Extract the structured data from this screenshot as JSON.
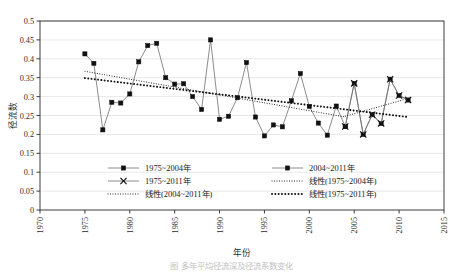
{
  "figure": {
    "caption": "图  多年平均径流深及径流系数变化",
    "background": "#ffffff",
    "plot_border_color": "#3c3c3c",
    "gridline_color": "#d6d6d6",
    "series_line_color": "#6e6e6e",
    "marker_color": "#111111",
    "trend_color": "#111111"
  },
  "chart_data": {
    "type": "line",
    "title": "",
    "xlabel": "年份",
    "ylabel": "径流数",
    "xlim": [
      1970,
      2015
    ],
    "ylim": [
      0,
      0.5
    ],
    "xticks": [
      1970,
      1975,
      1980,
      1985,
      1990,
      1995,
      2000,
      2005,
      2010,
      2015
    ],
    "yticks": [
      0,
      0.05,
      0.1,
      0.15,
      0.2,
      0.25,
      0.3,
      0.35,
      0.4,
      0.45,
      0.5
    ],
    "ytick_labels": [
      "0",
      "0.05",
      "0.1",
      "0.15",
      "0.2",
      "0.25",
      "0.3",
      "0.35",
      "0.4",
      "0.45",
      "0.5"
    ],
    "xtick_labels": [
      "1970",
      "1975",
      "1980",
      "1985",
      "1990",
      "1995",
      "2000",
      "2005",
      "2010",
      "2015"
    ],
    "grid": "horizontal",
    "legend_position": "inside-bottom",
    "series": [
      {
        "name": "1975~2004年",
        "marker": "square",
        "x": [
          1975,
          1976,
          1977,
          1978,
          1979,
          1980,
          1981,
          1982,
          1983,
          1984,
          1985,
          1986,
          1987,
          1988,
          1989,
          1990,
          1991,
          1992,
          1993,
          1994,
          1995,
          1996,
          1997,
          1998,
          1999,
          2000,
          2001,
          2002,
          2003,
          2004
        ],
        "values": [
          0.413,
          0.388,
          0.212,
          0.285,
          0.283,
          0.307,
          0.392,
          0.435,
          0.441,
          0.35,
          0.333,
          0.334,
          0.3,
          0.266,
          0.45,
          0.24,
          0.248,
          0.297,
          0.39,
          0.246,
          0.196,
          0.225,
          0.22,
          0.289,
          0.361,
          0.274,
          0.23,
          0.198,
          0.275,
          0.221
        ]
      },
      {
        "name": "2004~2011年",
        "marker": "square",
        "x": [
          2004,
          2005,
          2006,
          2007,
          2008,
          2009,
          2010,
          2011
        ],
        "values": [
          0.221,
          0.335,
          0.2,
          0.252,
          0.229,
          0.346,
          0.303,
          0.291
        ]
      },
      {
        "name": "1975~2011年",
        "marker": "cross",
        "x": [
          2004,
          2005,
          2006,
          2007,
          2008,
          2009,
          2010,
          2011
        ],
        "values": [
          0.221,
          0.335,
          0.2,
          0.252,
          0.229,
          0.346,
          0.303,
          0.291
        ]
      }
    ],
    "trendlines": [
      {
        "name": "线性(1975~2004年)",
        "style": "fine-dotted",
        "x": [
          1975,
          2004
        ],
        "y": [
          0.367,
          0.246
        ]
      },
      {
        "name": "线性(2004~2011年)",
        "style": "fine-dotted",
        "x": [
          2004,
          2011
        ],
        "y": [
          0.248,
          0.295
        ]
      },
      {
        "name": "线性(1975~2011年)",
        "style": "bold-dotted",
        "x": [
          1975,
          2011
        ],
        "y": [
          0.349,
          0.246
        ]
      }
    ]
  },
  "legend": {
    "items": [
      {
        "label": "1975~2004年",
        "type": "line-marker-square",
        "col": 0,
        "row": 0
      },
      {
        "label": "2004~2011年",
        "type": "line-marker-square",
        "col": 1,
        "row": 0
      },
      {
        "label": "1975~2011年",
        "type": "line-marker-cross",
        "col": 0,
        "row": 1
      },
      {
        "label": "线性(1975~2004年)",
        "type": "fine-dotted",
        "col": 1,
        "row": 1
      },
      {
        "label": "线性(2004~2011年)",
        "type": "fine-dotted",
        "col": 0,
        "row": 2
      },
      {
        "label": "线性(1975~2011年)",
        "type": "bold-dotted",
        "col": 1,
        "row": 2
      }
    ]
  }
}
